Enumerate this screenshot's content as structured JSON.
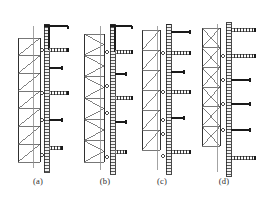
{
  "figure": {
    "kind": "technical-line-drawing",
    "background_color": "#ffffff",
    "ink_color": "#1a1a1a",
    "mid_color": "#555555",
    "light_color": "#8c8c8c",
    "hatch_color": "#4a4a4a",
    "panel_count": 4,
    "width": 259,
    "height": 203
  },
  "captions": [
    {
      "label": "(a)",
      "x": 38,
      "y": 183
    },
    {
      "label": "(b)",
      "x": 105,
      "y": 183
    },
    {
      "label": "(c)",
      "x": 162,
      "y": 183
    },
    {
      "label": "(d)",
      "x": 224,
      "y": 183
    }
  ],
  "panels": [
    {
      "id": "panel-a",
      "label": "(a)",
      "origin_x": 14,
      "truss": {
        "left_chord_x": 18,
        "right_chord_x": 40,
        "top_y": 38,
        "bottom_y": 162,
        "bays": 7,
        "pattern": "diagonal-n-brace"
      },
      "mast": {
        "x": 44,
        "top_y": 24,
        "bottom_y": 172,
        "width": 5,
        "style": "hatched-column"
      },
      "guide_line": {
        "x": 33,
        "top_y": 26,
        "bottom_y": 168
      },
      "arms": [
        {
          "y": 26,
          "x_end": 68,
          "style": "bracket",
          "riser_to": 50
        },
        {
          "y": 50,
          "x_end": 68,
          "style": "hatched"
        },
        {
          "y": 68,
          "x_end": 62,
          "style": "solid"
        },
        {
          "y": 93,
          "x_end": 68,
          "style": "hatched"
        },
        {
          "y": 120,
          "x_end": 62,
          "style": "solid"
        },
        {
          "y": 148,
          "x_end": 62,
          "style": "hatched"
        }
      ],
      "nodes": [
        {
          "x": 42,
          "y": 50
        },
        {
          "x": 42,
          "y": 93
        },
        {
          "x": 42,
          "y": 120
        },
        {
          "x": 42,
          "y": 155
        }
      ]
    },
    {
      "id": "panel-b",
      "label": "(b)",
      "origin_x": 80,
      "truss": {
        "left_chord_x": 84,
        "right_chord_x": 104,
        "top_y": 34,
        "bottom_y": 162,
        "bays": 6,
        "pattern": "diagonal-k-brace"
      },
      "mast": {
        "x": 110,
        "top_y": 24,
        "bottom_y": 174,
        "width": 5,
        "style": "hatched-column"
      },
      "guide_line": {
        "x": 100,
        "top_y": 26,
        "bottom_y": 170
      },
      "arms": [
        {
          "y": 26,
          "x_end": 132,
          "style": "bracket",
          "riser_to": 52
        },
        {
          "y": 52,
          "x_end": 132,
          "style": "hatched"
        },
        {
          "y": 74,
          "x_end": 126,
          "style": "solid"
        },
        {
          "y": 98,
          "x_end": 132,
          "style": "hatched"
        },
        {
          "y": 122,
          "x_end": 126,
          "style": "solid"
        },
        {
          "y": 152,
          "x_end": 126,
          "style": "hatched"
        }
      ],
      "nodes": [
        {
          "x": 107,
          "y": 52
        },
        {
          "x": 107,
          "y": 86
        },
        {
          "x": 107,
          "y": 113
        },
        {
          "x": 107,
          "y": 157
        }
      ]
    },
    {
      "id": "panel-c",
      "label": "(c)",
      "origin_x": 138,
      "truss": {
        "left_chord_x": 142,
        "right_chord_x": 160,
        "top_y": 30,
        "bottom_y": 150,
        "bays": 6,
        "pattern": "diagonal-n-brace"
      },
      "mast": {
        "x": 166,
        "top_y": 24,
        "bottom_y": 174,
        "width": 5,
        "style": "hatched-column"
      },
      "guide_line": {
        "x": 157,
        "top_y": 26,
        "bottom_y": 170
      },
      "arms": [
        {
          "y": 32,
          "x_end": 190,
          "style": "solid"
        },
        {
          "y": 53,
          "x_end": 190,
          "style": "hatched"
        },
        {
          "y": 72,
          "x_end": 184,
          "style": "solid"
        },
        {
          "y": 92,
          "x_end": 190,
          "style": "hatched"
        },
        {
          "y": 118,
          "x_end": 184,
          "style": "solid"
        },
        {
          "y": 152,
          "x_end": 190,
          "style": "hatched"
        }
      ],
      "nodes": [
        {
          "x": 163,
          "y": 53
        },
        {
          "x": 163,
          "y": 92
        },
        {
          "x": 163,
          "y": 120
        },
        {
          "x": 163,
          "y": 134
        },
        {
          "x": 163,
          "y": 156
        }
      ]
    },
    {
      "id": "panel-d",
      "label": "(d)",
      "origin_x": 198,
      "truss": {
        "left_chord_x": 202,
        "right_chord_x": 220,
        "top_y": 28,
        "bottom_y": 146,
        "bays": 6,
        "pattern": "cross-brace"
      },
      "mast": {
        "x": 226,
        "top_y": 22,
        "bottom_y": 176,
        "width": 5,
        "style": "hatched-column"
      },
      "guide_line": {
        "x": 217,
        "top_y": 24,
        "bottom_y": 172
      },
      "arms": [
        {
          "y": 30,
          "x_end": 255,
          "style": "hatched"
        },
        {
          "y": 56,
          "x_end": 255,
          "style": "hatched"
        },
        {
          "y": 80,
          "x_end": 250,
          "style": "solid"
        },
        {
          "y": 104,
          "x_end": 250,
          "style": "solid"
        },
        {
          "y": 130,
          "x_end": 250,
          "style": "solid"
        },
        {
          "y": 158,
          "x_end": 255,
          "style": "hatched"
        }
      ],
      "nodes": [
        {
          "x": 223,
          "y": 56
        },
        {
          "x": 223,
          "y": 80
        },
        {
          "x": 223,
          "y": 104
        },
        {
          "x": 223,
          "y": 130
        }
      ]
    }
  ]
}
